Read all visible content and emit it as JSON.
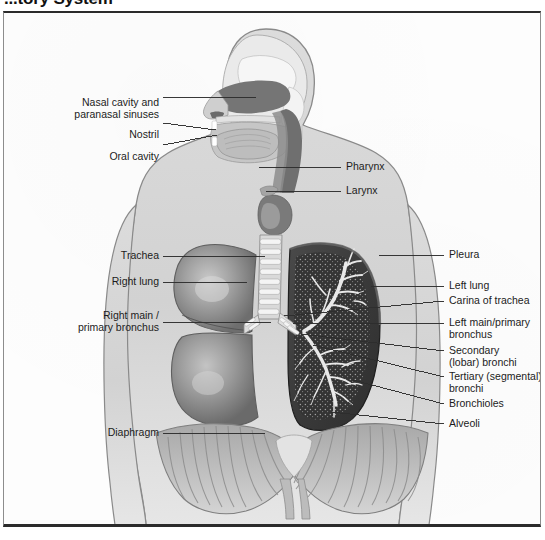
{
  "page": {
    "title": "...tory System",
    "title_note": "heading cropped at top edge of screenshot"
  },
  "figure": {
    "view": "anterior body with mid-sagittal head and neck section",
    "style": "grayscale medical illustration"
  },
  "labels_left": [
    {
      "id": "nasal-cavity",
      "text": "Nasal cavity and\nparanasal sinuses",
      "x": 36,
      "y": 83,
      "width": 122,
      "leader": {
        "x1": 162,
        "y1": 95,
        "x2": 255,
        "y2": 95
      }
    },
    {
      "id": "nostril",
      "text": "Nostril",
      "x": 36,
      "y": 116,
      "width": 122,
      "leader": {
        "x1": 162,
        "y1": 121,
        "x2": 215,
        "y2": 128
      }
    },
    {
      "id": "oral-cavity",
      "text": "Oral cavity",
      "x": 36,
      "y": 138,
      "width": 122,
      "leader": {
        "x1": 162,
        "y1": 143,
        "x2": 216,
        "y2": 133
      }
    },
    {
      "id": "trachea",
      "text": "Trachea",
      "x": 36,
      "y": 249,
      "width": 122,
      "leader": {
        "x1": 162,
        "y1": 254,
        "x2": 264,
        "y2": 254
      }
    },
    {
      "id": "right-lung",
      "text": "Right lung",
      "x": 36,
      "y": 275,
      "width": 122,
      "leader": {
        "x1": 162,
        "y1": 280,
        "x2": 246,
        "y2": 280
      }
    },
    {
      "id": "right-main-bronchus",
      "text": "Right main /\nprimary bronchus",
      "x": 18,
      "y": 308,
      "width": 140,
      "leader": {
        "x1": 162,
        "y1": 320,
        "x2": 270,
        "y2": 320
      }
    },
    {
      "id": "diaphragm",
      "text": "Diaphragm",
      "x": 36,
      "y": 426,
      "width": 122,
      "leader": {
        "x1": 162,
        "y1": 431,
        "x2": 264,
        "y2": 431
      }
    }
  ],
  "labels_right": [
    {
      "id": "pharynx",
      "text": "Pharynx",
      "x": 345,
      "y": 160,
      "leader": {
        "x1": 258,
        "y1": 165,
        "x2": 340,
        "y2": 165
      }
    },
    {
      "id": "larynx",
      "text": "Larynx",
      "x": 345,
      "y": 184,
      "leader": {
        "x1": 265,
        "y1": 189,
        "x2": 340,
        "y2": 189
      }
    },
    {
      "id": "pleura",
      "text": "Pleura",
      "x": 448,
      "y": 248,
      "leader": {
        "x1": 378,
        "y1": 253,
        "x2": 443,
        "y2": 253
      }
    },
    {
      "id": "left-lung",
      "text": "Left lung",
      "x": 448,
      "y": 279,
      "leader": {
        "x1": 370,
        "y1": 284,
        "x2": 443,
        "y2": 284
      }
    },
    {
      "id": "carina-of-trachea",
      "text": "Carina of trachea",
      "x": 448,
      "y": 294,
      "leader": {
        "x1": 283,
        "y1": 314,
        "x2": 443,
        "y2": 299
      }
    },
    {
      "id": "left-main-bronchus",
      "text": "Left main/primary\nbronchus",
      "x": 448,
      "y": 316,
      "leader": {
        "x1": 292,
        "y1": 322,
        "x2": 443,
        "y2": 321
      }
    },
    {
      "id": "secondary-bronchi",
      "text": "Secondary\n(lobar) bronchi",
      "x": 448,
      "y": 344,
      "leader": {
        "x1": 300,
        "y1": 332,
        "x2": 443,
        "y2": 349
      }
    },
    {
      "id": "tertiary-bronchi",
      "text": "Tertiary (segmental)\nbronchi",
      "x": 448,
      "y": 370,
      "leader": {
        "x1": 312,
        "y1": 343,
        "x2": 443,
        "y2": 375
      }
    },
    {
      "id": "bronchioles",
      "text": "Bronchioles",
      "x": 448,
      "y": 397,
      "leader": {
        "x1": 352,
        "y1": 378,
        "x2": 443,
        "y2": 402
      }
    },
    {
      "id": "alveoli",
      "text": "Alveoli",
      "x": 448,
      "y": 417,
      "leader": {
        "x1": 330,
        "y1": 410,
        "x2": 443,
        "y2": 422
      }
    }
  ],
  "colors": {
    "frame_dark": "#2b2b2b",
    "frame_side": "#8d8d8d",
    "paper": "#fdfdfd",
    "body_fill": "#d5d5d5",
    "body_outline": "#8a8a8a",
    "right_lung": "#9a9a9a",
    "left_lung_dark": "#3c3c3c",
    "airway_dark": "#6f6f6f",
    "nasal_dark": "#7d7d7d",
    "bone_light": "#efefef",
    "diaphragm": "#b3b3b3",
    "label_text": "#1c1c1c",
    "leader_line": "#2d2d2d"
  }
}
